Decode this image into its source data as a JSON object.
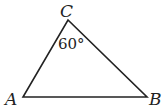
{
  "diagram": {
    "type": "triangle",
    "vertices": {
      "A": {
        "label": "A",
        "x": 23,
        "y": 97
      },
      "B": {
        "label": "B",
        "x": 147,
        "y": 97
      },
      "C": {
        "label": "C",
        "x": 68,
        "y": 20
      }
    },
    "angle_label": "60°",
    "angle_at": "C",
    "stroke_color": "#222222"
  }
}
